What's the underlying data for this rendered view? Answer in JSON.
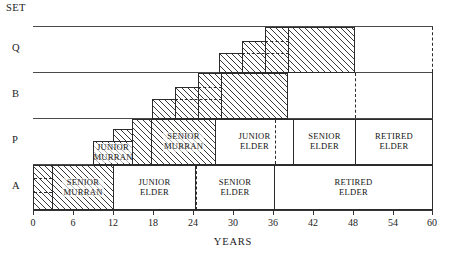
{
  "chart_data": {
    "type": "table",
    "title": "",
    "xlabel": "YEARS",
    "ylabel": "SET",
    "xlim": [
      0,
      60
    ],
    "xticks": [
      0,
      6,
      12,
      18,
      24,
      30,
      36,
      42,
      48,
      54,
      60
    ],
    "grid": false,
    "legend": "none",
    "row_axis_title": "SET",
    "rows": [
      {
        "name": "Q",
        "segments": [
          {
            "label": "",
            "start": 35.0,
            "end": 38.5,
            "hatched": true,
            "step": 3
          },
          {
            "label": "",
            "start": 31.5,
            "end": 35.0,
            "hatched": true,
            "step": 2
          },
          {
            "label": "",
            "start": 28.0,
            "end": 31.5,
            "hatched": true,
            "step": 1
          },
          {
            "label": "",
            "start": 38.5,
            "end": 48.5,
            "hatched": true,
            "step": 4
          }
        ],
        "markers": [
          {
            "year": 60.0,
            "style": "dashed"
          }
        ]
      },
      {
        "name": "B",
        "segments": [
          {
            "label": "",
            "start": 23.0,
            "end": 26.5,
            "hatched": true,
            "step": 3
          },
          {
            "label": "",
            "start": 19.5,
            "end": 23.0,
            "hatched": true,
            "step": 2
          },
          {
            "label": "",
            "start": 16.0,
            "end": 19.5,
            "hatched": true,
            "step": 1
          },
          {
            "label": "",
            "start": 26.5,
            "end": 36.5,
            "hatched": true,
            "step": 4
          }
        ],
        "markers": [
          {
            "year": 48.5,
            "style": "dashed"
          },
          {
            "year": 60.0,
            "style": "solid"
          }
        ]
      },
      {
        "name": "P",
        "segments": [
          {
            "label": "JUNIOR MURRAN",
            "start": 9.0,
            "end": 15.0,
            "hatched": true
          },
          {
            "label": "SENIOR MURRAN",
            "start": 15.0,
            "end": 24.5,
            "hatched": true
          },
          {
            "label": "JUNIOR ELDER",
            "start": 24.5,
            "end": 36.5,
            "hatched": false
          },
          {
            "label": "SENIOR ELDER",
            "start": 36.5,
            "end": 48.5,
            "hatched": false
          },
          {
            "label": "RETIRED ELDER",
            "start": 48.5,
            "end": 60.0,
            "hatched": false
          }
        ],
        "markers": [
          {
            "year": 36.5,
            "style": "dashed"
          }
        ]
      },
      {
        "name": "A",
        "segments": [
          {
            "label": "",
            "start": 0.0,
            "end": 3.0,
            "hatched": true
          },
          {
            "label": "SENIOR MURRAN",
            "start": 3.0,
            "end": 12.0,
            "hatched": true
          },
          {
            "label": "JUNIOR ELDER",
            "start": 12.0,
            "end": 24.5,
            "hatched": false
          },
          {
            "label": "SENIOR ELDER",
            "start": 24.5,
            "end": 36.5,
            "hatched": false
          },
          {
            "label": "RETIRED ELDER",
            "start": 36.5,
            "end": 60.0,
            "hatched": false
          }
        ],
        "markers": [
          {
            "year": 24.5,
            "style": "dashed"
          }
        ]
      }
    ]
  },
  "axis": {
    "title": "YEARS",
    "set_label": "SET",
    "ticks": [
      {
        "value": 0,
        "label": "0"
      },
      {
        "value": 6,
        "label": "6"
      },
      {
        "value": 12,
        "label": "12"
      },
      {
        "value": 18,
        "label": "18"
      },
      {
        "value": 24,
        "label": "24"
      },
      {
        "value": 30,
        "label": "30"
      },
      {
        "value": 36,
        "label": "36"
      },
      {
        "value": 42,
        "label": "42"
      },
      {
        "value": 48,
        "label": "48"
      },
      {
        "value": 54,
        "label": "54"
      },
      {
        "value": 60,
        "label": "60"
      }
    ]
  },
  "row_labels": [
    {
      "name": "SET"
    },
    {
      "name": "Q"
    },
    {
      "name": "B"
    },
    {
      "name": "P"
    },
    {
      "name": "A"
    }
  ],
  "labels": {
    "junior_murran": "JUNIOR\nMURRAN",
    "senior_murran": "SENIOR\nMURRAN",
    "junior_elder": "JUNIOR\nELDER",
    "senior_elder": "SENIOR\nELDER",
    "retired_elder": "RETIRED\nELDER"
  },
  "colors": {
    "ink": "#2b2b2b",
    "rule": "#4a4a4a",
    "background": "#ffffff"
  }
}
